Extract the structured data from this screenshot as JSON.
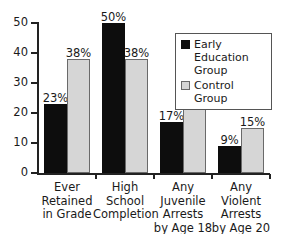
{
  "chart_data": {
    "type": "bar",
    "title": "",
    "xlabel": "",
    "ylabel": "",
    "ylim": [
      0,
      50
    ],
    "yticks": [
      0,
      10,
      20,
      30,
      40,
      50
    ],
    "ytick_labels": [
      "0",
      "10",
      "20",
      "30",
      "40",
      "50"
    ],
    "grid": false,
    "legend_position": "top-right",
    "categories": [
      "Ever\nRetained\nin Grade",
      "High School\nCompletion",
      "Any Juvenile\nArrests\nby Age 18",
      "Any Violent\nArrests\nby Age 20"
    ],
    "series": [
      {
        "name": "Early Education Group",
        "color": "#0d0d0d",
        "values": [
          23,
          50,
          17,
          9
        ],
        "labels": [
          "23%",
          "50%",
          "17%",
          "9%"
        ]
      },
      {
        "name": "Control Group",
        "color": "#d6d6d6",
        "values": [
          38,
          38,
          25,
          15
        ],
        "labels": [
          "38%",
          "38%",
          "25%",
          "15%"
        ]
      }
    ]
  },
  "legend": {
    "items": [
      {
        "label": "Early Education Group",
        "swatch": "dark"
      },
      {
        "label": "Control Group",
        "swatch": "light"
      }
    ]
  }
}
